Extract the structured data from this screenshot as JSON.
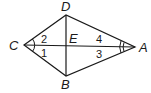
{
  "figure": {
    "type": "quadrilateral-with-diagonals",
    "vertices": [
      {
        "name": "C",
        "x": 24,
        "y": 45
      },
      {
        "name": "D",
        "x": 66,
        "y": 15
      },
      {
        "name": "A",
        "x": 135,
        "y": 47
      },
      {
        "name": "B",
        "x": 66,
        "y": 76
      }
    ],
    "intersection": {
      "name": "E",
      "x": 66,
      "y": 46
    },
    "angle_labels": [
      {
        "name": "2",
        "position": "upper-left of E near C"
      },
      {
        "name": "1",
        "position": "lower-left of E near C"
      },
      {
        "name": "4",
        "position": "upper-right of E near A"
      },
      {
        "name": "3",
        "position": "lower-right of E near A"
      }
    ],
    "angle_marks": [
      {
        "vertex": "C",
        "arcs": 1
      },
      {
        "vertex": "A",
        "arcs": 2
      }
    ],
    "stroke_color": "#1a1a1a"
  },
  "labels": {
    "C": "C",
    "D": "D",
    "A": "A",
    "B": "B",
    "E": "E",
    "n1": "1",
    "n2": "2",
    "n3": "3",
    "n4": "4"
  }
}
